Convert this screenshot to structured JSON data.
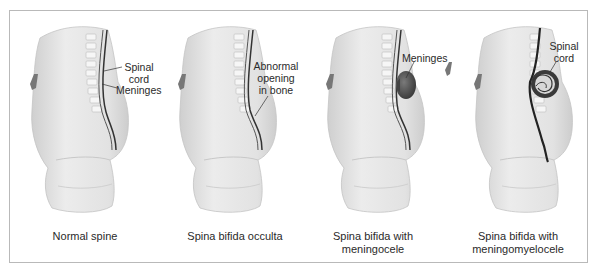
{
  "figure": {
    "panels": [
      {
        "id": "normal",
        "caption_lines": [
          "Normal spine"
        ],
        "labels": [
          {
            "lines": [
              "Spinal",
              "cord"
            ]
          },
          {
            "lines": [
              "Meninges"
            ]
          }
        ]
      },
      {
        "id": "occulta",
        "caption_lines": [
          "Spina bifida occulta"
        ],
        "labels": [
          {
            "lines": [
              "Abnormal",
              "opening",
              "in bone"
            ]
          }
        ]
      },
      {
        "id": "meningocele",
        "caption_lines": [
          "Spina bifida with",
          "meningocele"
        ],
        "labels": [
          {
            "lines": [
              "Meninges"
            ]
          }
        ]
      },
      {
        "id": "meningomyelocele",
        "caption_lines": [
          "Spina bifida with",
          "meningomyelocele"
        ],
        "labels": [
          {
            "lines": [
              "Spinal",
              "cord"
            ]
          }
        ]
      }
    ]
  },
  "colors": {
    "frame_border": "#b9b9b9",
    "skin": "#e6e6e6",
    "skin_shadow": "#cfcfcf",
    "vertebra": "#f4f4f4",
    "spinal_cord": "#3a3a3a",
    "sac": "#5a5a5a",
    "text": "#2a2a2a"
  }
}
